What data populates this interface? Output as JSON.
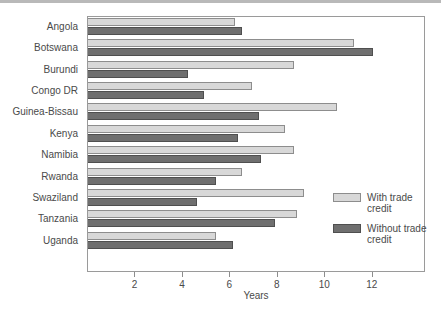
{
  "chart_data": {
    "type": "bar",
    "orientation": "horizontal",
    "title": "",
    "xlabel": "Years",
    "ylabel": "",
    "xlim": [
      0,
      14.2
    ],
    "xticks": [
      2,
      4,
      6,
      8,
      10,
      12
    ],
    "xticklabels": [
      "2",
      "4",
      "6",
      "8",
      "10",
      "12"
    ],
    "grid": false,
    "legend_position": "inside-right",
    "categories": [
      "Angola",
      "Botswana",
      "Burundi",
      "Congo DR",
      "Guinea-Bissau",
      "Kenya",
      "Namibia",
      "Rwanda",
      "Swaziland",
      "Tanzania",
      "Uganda"
    ],
    "series": [
      {
        "name": "With trade credit",
        "color": "#d8d8d8",
        "values": [
          6.2,
          11.2,
          8.7,
          6.9,
          10.5,
          8.3,
          8.7,
          6.5,
          9.1,
          8.8,
          5.4
        ]
      },
      {
        "name": "Without trade credit",
        "color": "#6f6f6f",
        "values": [
          6.5,
          12.0,
          4.2,
          4.9,
          7.2,
          6.3,
          7.3,
          5.4,
          4.6,
          7.9,
          6.1
        ]
      }
    ]
  },
  "legend": {
    "items": [
      {
        "label": "With trade credit",
        "swatch": "light"
      },
      {
        "label": "Without trade credit",
        "swatch": "dark"
      }
    ]
  },
  "axis": {
    "x_title": "Years"
  }
}
